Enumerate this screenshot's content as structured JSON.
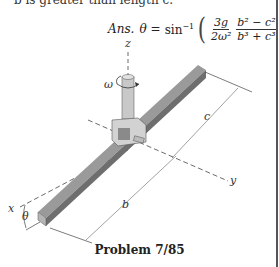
{
  "problem": {
    "truncated_text": "b is greater than length c.",
    "answer": {
      "label": "Ans.",
      "variable": "θ",
      "equals": "=",
      "function": "sin",
      "function_sup": "−1",
      "open_paren": "(",
      "close_paren": ")",
      "frac1_num": "3g",
      "frac1_den": "2ω²",
      "frac2_num": "b² − c²",
      "frac2_den": "b³ + c³"
    },
    "caption": "Problem 7/85"
  },
  "figure": {
    "labels": {
      "z": "z",
      "omega": "ω",
      "c": "c",
      "y": "y",
      "x": "x",
      "theta": "θ",
      "b": "b"
    },
    "colors": {
      "bar_top": "#9a9a9a",
      "bar_side": "#6e6e6e",
      "bar_end": "#b5b5b5",
      "shaft": "#c8c8c8",
      "clevis": "#d2d2d2",
      "line": "#444444"
    }
  }
}
